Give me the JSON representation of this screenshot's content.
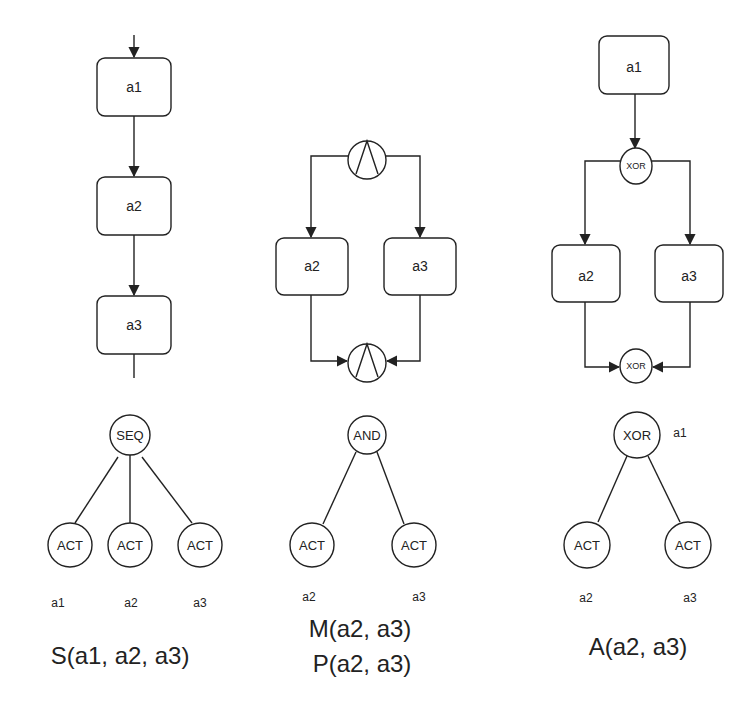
{
  "diagrams": [
    {
      "id": "sequence",
      "process": {
        "boxes": [
          "a1",
          "a2",
          "a3"
        ]
      },
      "tree": {
        "root": "SEQ",
        "children": [
          "ACT",
          "ACT",
          "ACT"
        ],
        "leaf_labels": [
          "a1",
          "a2",
          "a3"
        ]
      },
      "formulas": [
        "S(a1, a2, a3)"
      ]
    },
    {
      "id": "and",
      "process": {
        "split_gateway": "∧",
        "join_gateway": "∧",
        "boxes": [
          "a2",
          "a3"
        ]
      },
      "tree": {
        "root": "AND",
        "children": [
          "ACT",
          "ACT"
        ],
        "leaf_labels": [
          "a2",
          "a3"
        ]
      },
      "formulas": [
        "M(a2, a3)",
        "P(a2, a3)"
      ]
    },
    {
      "id": "xor",
      "process": {
        "start_box": "a1",
        "split_gateway": "XOR",
        "join_gateway": "XOR",
        "boxes": [
          "a2",
          "a3"
        ]
      },
      "tree": {
        "root": "XOR",
        "root_annotation": "a1",
        "children": [
          "ACT",
          "ACT"
        ],
        "leaf_labels": [
          "a2",
          "a3"
        ]
      },
      "formulas": [
        "A(a2, a3)"
      ]
    }
  ]
}
